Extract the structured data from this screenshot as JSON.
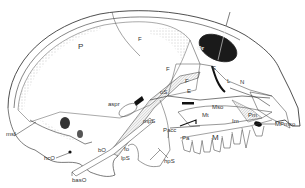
{
  "figure": {
    "labels": {
      "P": "P",
      "F_top": "F",
      "Or": "Or",
      "F_mid": "F",
      "F_lower": "F",
      "E_upper": "E",
      "E_lower": "E",
      "L": "L",
      "N": "N",
      "oS": "oS",
      "aspr": "aspr",
      "mpS_upper": "mpS",
      "Pacc": "Pacc",
      "Mt": "Mt",
      "Mso": "Mso",
      "Pm": "Pm",
      "Im": "Im",
      "MPmso": "MPmso",
      "Pa": "Pa",
      "M": "M",
      "fo": "fo",
      "lpS": "lpS",
      "hpS": "hpS",
      "bO": "bO",
      "hcO": "hcO",
      "basO": "basO",
      "msf": "msf"
    }
  }
}
